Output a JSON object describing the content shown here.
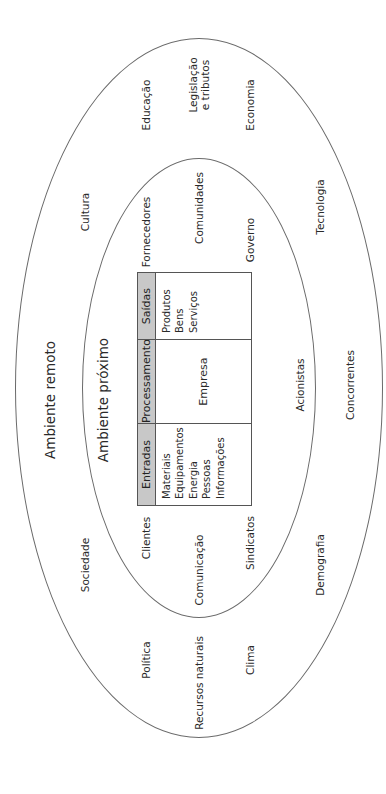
{
  "diagram": {
    "outer_ellipse": {
      "title": "Ambiente remoto"
    },
    "inner_ellipse": {
      "title": "Ambiente próximo"
    },
    "remote_factors": {
      "educacao": "Educação",
      "legislacao_line1": "Legislação",
      "legislacao_line2": "e tributos",
      "economia": "Economia",
      "cultura": "Cultura",
      "tecnologia": "Tecnologia",
      "concorrentes": "Concorrentes",
      "sociedade": "Sociedade",
      "demografia": "Demografia",
      "politica": "Política",
      "recursos_naturais": "Recursos naturais",
      "clima": "Clima"
    },
    "near_factors": {
      "fornecedores": "Fornecedores",
      "comunidades": "Comunidades",
      "governo": "Governo",
      "acionistas": "Acionistas",
      "clientes": "Clientes",
      "comunicacao": "Comunicação",
      "sindicatos": "Sindicatos"
    },
    "company_table": {
      "columns": [
        {
          "header": "Entradas",
          "items": [
            "Materiais",
            "Equipamentos",
            "Energia",
            "Pessoas",
            "Informações"
          ]
        },
        {
          "header": "Processamento",
          "items": [
            "Empresa"
          ]
        },
        {
          "header": "Saídas",
          "items": [
            "Produtos",
            "Bens",
            "Serviços"
          ]
        }
      ]
    },
    "colors": {
      "header_fill": "#c8c8c8",
      "line": "#555555",
      "text": "#2a2a2a"
    }
  }
}
